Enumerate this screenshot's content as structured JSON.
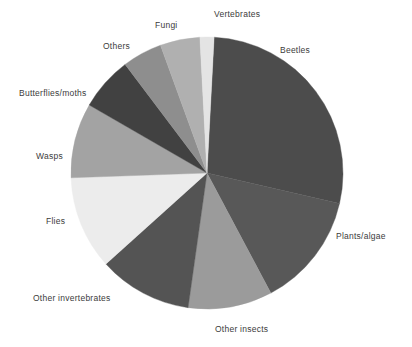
{
  "chart_data": {
    "type": "pie",
    "title": "",
    "subtitle": "",
    "xlabel": "",
    "ylabel": "",
    "legend_position": "none",
    "labels_position": "outside-leaderless",
    "grid": false,
    "total_degrees": 360,
    "start_angle_deg": 3,
    "direction": "clockwise",
    "categories": [
      "Beetles",
      "Plants/algae",
      "Other insects",
      "Other invertebrates",
      "Flies",
      "Wasps",
      "Butterflies/moths",
      "Others",
      "Fungi",
      "Vertebrates"
    ],
    "values": [
      27.8,
      13.6,
      10.0,
      11.1,
      11.1,
      8.9,
      6.4,
      4.7,
      4.7,
      1.7
    ],
    "slices": [
      {
        "label": "Beetles",
        "value": 27.8,
        "start_deg": 3,
        "end_deg": 103,
        "color": "#4c4c4c"
      },
      {
        "label": "Plants/algae",
        "value": 13.6,
        "start_deg": 103,
        "end_deg": 152,
        "color": "#585858"
      },
      {
        "label": "Other insects",
        "value": 10.0,
        "start_deg": 152,
        "end_deg": 188,
        "color": "#9b9b9b"
      },
      {
        "label": "Other invertebrates",
        "value": 11.1,
        "start_deg": 188,
        "end_deg": 228,
        "color": "#545454"
      },
      {
        "label": "Flies",
        "value": 11.1,
        "start_deg": 228,
        "end_deg": 268,
        "color": "#ececec"
      },
      {
        "label": "Wasps",
        "value": 8.9,
        "start_deg": 268,
        "end_deg": 300,
        "color": "#a3a3a3"
      },
      {
        "label": "Butterflies/moths",
        "value": 6.4,
        "start_deg": 300,
        "end_deg": 323,
        "color": "#414141"
      },
      {
        "label": "Others",
        "value": 4.7,
        "start_deg": 323,
        "end_deg": 340,
        "color": "#8e8e8e"
      },
      {
        "label": "Fungi",
        "value": 4.7,
        "start_deg": 340,
        "end_deg": 357,
        "color": "#b0b0b0"
      },
      {
        "label": "Vertebrates",
        "value": 1.7,
        "start_deg": 357,
        "end_deg": 363,
        "color": "#e4e4e4"
      }
    ],
    "geometry": {
      "center_x": 207,
      "center_y": 173,
      "radius": 136
    },
    "colors": {
      "beetles": "#4c4c4c",
      "plants_algae": "#585858",
      "other_insects": "#9b9b9b",
      "other_invertebrates": "#545454",
      "flies": "#ececec",
      "wasps": "#a3a3a3",
      "butterflies_moths": "#414141",
      "others": "#8e8e8e",
      "fungi": "#b0b0b0",
      "vertebrates": "#e4e4e4",
      "background": "#ffffff",
      "label_text": "#3b3b3b"
    }
  },
  "labels": {
    "beetles": "Beetles",
    "plants_algae": "Plants/algae",
    "other_insects": "Other insects",
    "other_invertebrates": "Other invertebrates",
    "flies": "Flies",
    "wasps": "Wasps",
    "butterflies_moths": "Butterflies/moths",
    "others": "Others",
    "fungi": "Fungi",
    "vertebrates": "Vertebrates"
  }
}
